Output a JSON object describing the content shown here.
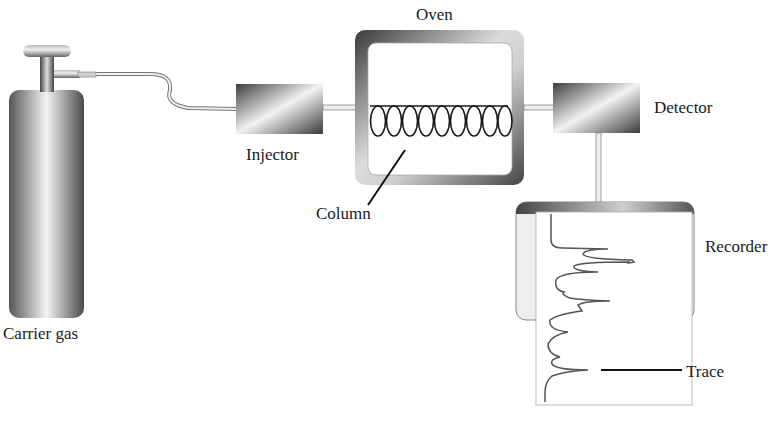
{
  "diagram": {
    "components": [
      {
        "id": "carrier-gas",
        "label": "Carrier gas"
      },
      {
        "id": "injector",
        "label": "Injector"
      },
      {
        "id": "oven",
        "label": "Oven"
      },
      {
        "id": "column",
        "label": "Column"
      },
      {
        "id": "detector",
        "label": "Detector"
      },
      {
        "id": "recorder",
        "label": "Recorder"
      },
      {
        "id": "trace",
        "label": "Trace"
      }
    ],
    "connections": [
      {
        "from": "carrier-gas",
        "to": "injector"
      },
      {
        "from": "injector",
        "to": "oven"
      },
      {
        "from": "oven",
        "to": "detector"
      },
      {
        "from": "detector",
        "to": "recorder"
      }
    ],
    "column_coil_loops": 9,
    "colors": {
      "metal_dark": "#4a4a4a",
      "metal_light": "#f2f2f2",
      "line": "#222222",
      "trace": "#555555"
    }
  },
  "labels": {
    "carrier_gas": "Carrier gas",
    "injector": "Injector",
    "oven": "Oven",
    "column": "Column",
    "detector": "Detector",
    "recorder": "Recorder",
    "trace": "Trace"
  }
}
